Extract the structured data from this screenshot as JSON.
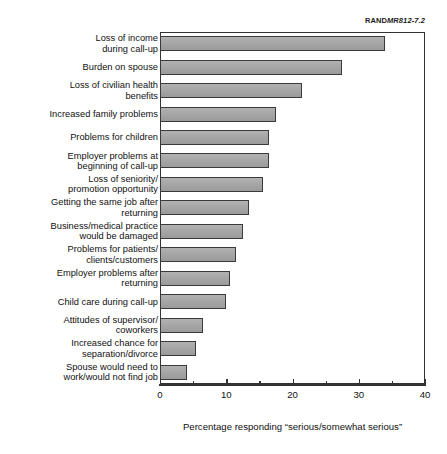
{
  "source_id": {
    "prefix": "RAND",
    "number": "MR812-7.2",
    "full": "RANDMR812-7.2"
  },
  "chart_data": {
    "type": "bar",
    "orientation": "horizontal",
    "title": "",
    "subtitle": "",
    "xlabel": "Percentage responding “serious/somewhat serious”",
    "ylabel": "",
    "xlim": [
      0,
      40
    ],
    "xticks": [
      0,
      10,
      20,
      30,
      40
    ],
    "xtick_labels": [
      "0",
      "10",
      "20",
      "30",
      "40"
    ],
    "minor_tick_interval": 5,
    "grid": false,
    "legend": null,
    "bar_color": "#a9a9a9",
    "bar_edge_color": "#3a3a3a",
    "categories": [
      "Loss of income\nduring call-up",
      "Burden on spouse",
      "Loss of civilian health\nbenefits",
      "Increased family problems",
      "Problems for children",
      "Employer problems at\nbeginning of call-up",
      "Loss of seniority/\npromotion opportunity",
      "Getting the same job after\nreturning",
      "Business/medical practice\nwould be damaged",
      "Problems for patients/\nclients/customers",
      "Employer problems after\nreturning",
      "Child care during call-up",
      "Attitudes of supervisor/\ncoworkers",
      "Increased chance for\nseparation/divorce",
      "Spouse would need to\nwork/would not find job"
    ],
    "values": [
      34,
      27.5,
      21.5,
      17.5,
      16.5,
      16.5,
      15.5,
      13.5,
      12.5,
      11.5,
      10.5,
      10,
      6.5,
      5.5,
      4
    ]
  }
}
